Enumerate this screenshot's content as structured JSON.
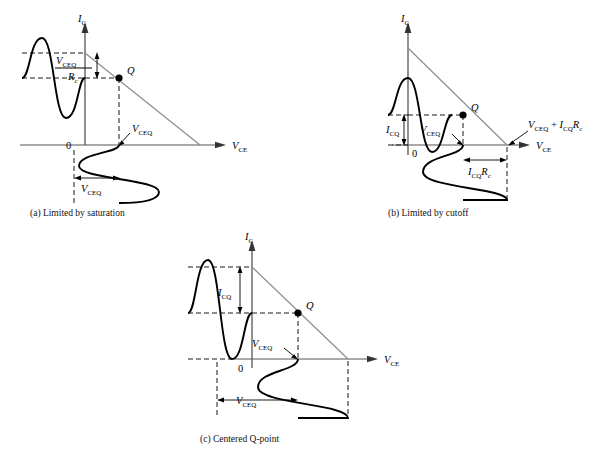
{
  "figure": {
    "type": "engineering-diagram",
    "axis_labels": {
      "y": "I_C",
      "y_symbol": "I",
      "y_subscript": "C",
      "x": "V_CE",
      "x_symbol": "V",
      "x_subscript": "CE",
      "origin": "0"
    },
    "colors": {
      "curve": "#000000",
      "loadline": "#808080",
      "axis": "#555555",
      "dashed": "#000000",
      "qpoint": "#000000"
    }
  },
  "panels": [
    {
      "id": "a",
      "caption": "(a) Limited by saturation",
      "q_label": "Q",
      "q_position_note": "high on load line, near saturation",
      "labels": [
        {
          "name": "vceq-over-rc",
          "kind": "fraction",
          "numerator_symbol": "V",
          "numerator_subscript": "CEQ",
          "denominator_symbol": "R",
          "denominator_subscript": "c",
          "text": "V_CEQ / R_c"
        },
        {
          "name": "vceq-axis-callout",
          "symbol": "V",
          "subscript": "CEQ",
          "text": "V_CEQ"
        },
        {
          "name": "vceq-dimension",
          "symbol": "V",
          "subscript": "CEQ",
          "text": "V_CEQ"
        }
      ]
    },
    {
      "id": "b",
      "caption": "(b) Limited by cutoff",
      "q_label": "Q",
      "q_position_note": "low on load line, near cutoff",
      "labels": [
        {
          "name": "icq-dimension",
          "symbol": "I",
          "subscript": "CQ",
          "text": "I_CQ"
        },
        {
          "name": "vceq-axis-callout",
          "symbol": "V",
          "subscript": "CEQ",
          "text": "V_CEQ"
        },
        {
          "name": "vceq-plus-icqrc-callout",
          "text": "V_CEQ + I_CQ R_c",
          "parts": [
            {
              "symbol": "V",
              "subscript": "CEQ"
            },
            {
              "operator": "+"
            },
            {
              "symbol": "I",
              "subscript": "CQ"
            },
            {
              "symbol": "R",
              "subscript": "c"
            }
          ]
        },
        {
          "name": "icqrc-dimension",
          "text": "I_CQ R_c",
          "parts": [
            {
              "symbol": "I",
              "subscript": "CQ"
            },
            {
              "symbol": "R",
              "subscript": "c"
            }
          ]
        }
      ]
    },
    {
      "id": "c",
      "caption": "(c) Centered Q-point",
      "q_label": "Q",
      "q_position_note": "centered on load line",
      "labels": [
        {
          "name": "icq-dimension",
          "symbol": "I",
          "subscript": "CQ",
          "text": "I_CQ"
        },
        {
          "name": "vceq-axis-callout",
          "symbol": "V",
          "subscript": "CEQ",
          "text": "V_CEQ"
        },
        {
          "name": "vceq-dimension",
          "symbol": "V",
          "subscript": "CEQ",
          "text": "V_CEQ"
        }
      ]
    }
  ]
}
